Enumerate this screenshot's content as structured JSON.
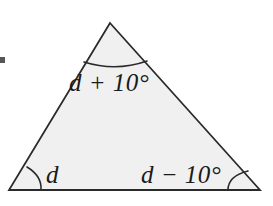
{
  "figure": {
    "type": "geometry-diagram",
    "width": 273,
    "height": 206,
    "background_color": "#ffffff"
  },
  "triangle": {
    "fill_color": "#f0f0f0",
    "stroke_color": "#2a2a2a",
    "stroke_width": 1.8,
    "vertices": {
      "apex": {
        "x": 110,
        "y": 23
      },
      "bottom_left": {
        "x": 9,
        "y": 190
      },
      "bottom_right": {
        "x": 260,
        "y": 190
      }
    },
    "path": "M 110 23 L 260 190 L 9 190 Z"
  },
  "angle_arcs": {
    "stroke_color": "#2a2a2a",
    "stroke_width": 1.6,
    "apex": {
      "name": "apex-angle-arc",
      "path": "M 84 62 Q 116 72 147 61"
    },
    "bottom_left": {
      "name": "bottom-left-angle-arc",
      "path": "M 27 167 Q 42 176 41 190"
    },
    "bottom_right": {
      "name": "bottom-right-angle-arc",
      "path": "M 228 190 Q 228 176 248 171"
    }
  },
  "labels": {
    "apex": "d + 10°",
    "bottom_left": "d",
    "bottom_right": "d − 10°"
  },
  "artifact": {
    "name": "scan-artifact",
    "color": "#3a3a3a"
  }
}
